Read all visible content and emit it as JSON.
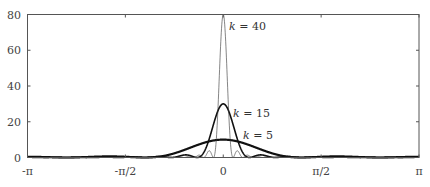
{
  "chart_data": {
    "type": "line",
    "title": "",
    "xlabel": "",
    "ylabel": "",
    "xlim": [
      -3.14159,
      3.14159
    ],
    "ylim": [
      0,
      80
    ],
    "grid": false,
    "x_ticks": [
      {
        "value": -3.14159,
        "label": "-π"
      },
      {
        "value": -1.5708,
        "label": "-π/2"
      },
      {
        "value": 0,
        "label": "0"
      },
      {
        "value": 1.5708,
        "label": "π/2"
      },
      {
        "value": 3.14159,
        "label": "π"
      }
    ],
    "y_ticks": [
      {
        "value": 0,
        "label": "0"
      },
      {
        "value": 20,
        "label": "20"
      },
      {
        "value": 40,
        "label": "40"
      },
      {
        "value": 60,
        "label": "60"
      },
      {
        "value": 80,
        "label": "80"
      }
    ],
    "series": [
      {
        "name": "k = 5",
        "k": 5,
        "peak": 10,
        "stroke": "#111111",
        "width": 2.2
      },
      {
        "name": "k = 15",
        "k": 15,
        "peak": 30,
        "stroke": "#111111",
        "width": 1.6
      },
      {
        "name": "k = 40",
        "k": 40,
        "peak": 80,
        "stroke": "#333333",
        "width": 0.6
      }
    ],
    "annotations": [
      {
        "text": "k = 40",
        "x": 0.2,
        "y": 73
      },
      {
        "text": "k = 15",
        "x": 0.2,
        "y": 27
      },
      {
        "text": "k = 5",
        "x": 0.35,
        "y": 15
      }
    ]
  },
  "labels": {
    "ann_k40_k": "k",
    "ann_k40_rest": " = 40",
    "ann_k15_k": "k",
    "ann_k15_rest": " = 15",
    "ann_k5_k": "k",
    "ann_k5_rest": " = 5"
  }
}
